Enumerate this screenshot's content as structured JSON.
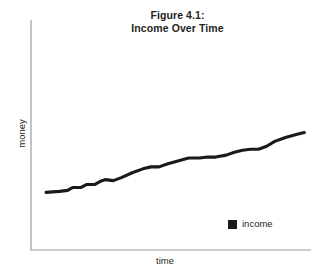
{
  "figure": {
    "title_line1": "Figure 4.1:",
    "title_line2": "Income Over Time",
    "background_color": "#ffffff",
    "axis_color": "#9b9b9b",
    "series_color": "#1a1a1a",
    "text_color": "#231f20"
  },
  "legend": {
    "position": "inside-bottom-right",
    "entries": [
      {
        "label": "income",
        "marker": "filled-square",
        "color": "#1a1a1a"
      }
    ]
  },
  "axes": {
    "x_label": "time",
    "y_label": "money"
  },
  "chart_data": {
    "type": "line",
    "title": "Figure 4.1: Income Over Time",
    "xlabel": "time",
    "ylabel": "money",
    "grid": false,
    "legend_position": "inside-bottom-right",
    "axis_ticks": "none",
    "xlim": [
      0,
      100
    ],
    "ylim": [
      0,
      100
    ],
    "series": [
      {
        "name": "income",
        "color": "#1a1a1a",
        "x": [
          3,
          8,
          11,
          13,
          16,
          18,
          21,
          23,
          25,
          28,
          31,
          35,
          39,
          42,
          45,
          48,
          52,
          56,
          60,
          63,
          66,
          70,
          73,
          76,
          79,
          82,
          85,
          88,
          92,
          96,
          99
        ],
        "y": [
          18,
          19,
          20,
          23,
          23,
          26,
          26,
          29,
          31,
          30,
          33,
          38,
          42,
          44,
          44,
          47,
          50,
          53,
          53,
          54,
          54,
          56,
          59,
          61,
          62,
          62,
          65,
          70,
          74,
          77,
          79
        ]
      }
    ]
  }
}
